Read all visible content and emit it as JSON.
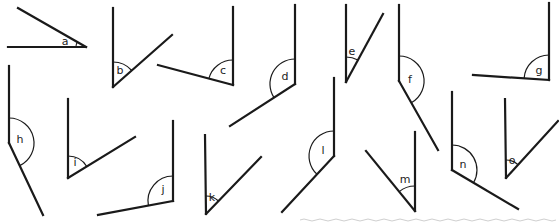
{
  "diagram": {
    "colors": {
      "line": "#1a1a1a",
      "background": "#ffffff"
    },
    "angles": [
      {
        "label": "a",
        "vertex": [
          86,
          47
        ],
        "arm1": [
          8,
          47
        ],
        "arm2": [
          18,
          8
        ],
        "r": 10,
        "lx": 65,
        "ly": 42
      },
      {
        "label": "b",
        "vertex": [
          113,
          87
        ],
        "arm1": [
          113,
          8
        ],
        "arm2": [
          172,
          35
        ],
        "r": 25,
        "lx": 120,
        "ly": 71
      },
      {
        "label": "c",
        "vertex": [
          233,
          85
        ],
        "arm1": [
          233,
          7
        ],
        "arm2": [
          158,
          65
        ],
        "r": 25,
        "lx": 223,
        "ly": 71
      },
      {
        "label": "d",
        "vertex": [
          295,
          84
        ],
        "arm1": [
          295,
          5
        ],
        "arm2": [
          230,
          126
        ],
        "r": 25,
        "lx": 285,
        "ly": 77
      },
      {
        "label": "e",
        "vertex": [
          346,
          82
        ],
        "arm1": [
          346,
          5
        ],
        "arm2": [
          383,
          14
        ],
        "r": 25,
        "lx": 352,
        "ly": 52
      },
      {
        "label": "f",
        "vertex": [
          399,
          81
        ],
        "arm1": [
          399,
          5
        ],
        "arm2": [
          438,
          150
        ],
        "r": 25,
        "lx": 410,
        "ly": 80
      },
      {
        "label": "g",
        "vertex": [
          549,
          80
        ],
        "arm1": [
          549,
          3
        ],
        "arm2": [
          473,
          75
        ],
        "r": 25,
        "lx": 539,
        "ly": 71
      },
      {
        "label": "h",
        "vertex": [
          9,
          143
        ],
        "arm1": [
          9,
          66
        ],
        "arm2": [
          43,
          215
        ],
        "r": 25,
        "lx": 20,
        "ly": 140
      },
      {
        "label": "i",
        "vertex": [
          68,
          178
        ],
        "arm1": [
          68,
          99
        ],
        "arm2": [
          135,
          137
        ],
        "r": 22,
        "lx": 75,
        "ly": 163
      },
      {
        "label": "j",
        "vertex": [
          173,
          201
        ],
        "arm1": [
          173,
          121
        ],
        "arm2": [
          98,
          215
        ],
        "r": 25,
        "lx": 163,
        "ly": 190
      },
      {
        "label": "k",
        "vertex": [
          206,
          214
        ],
        "arm1": [
          205,
          135
        ],
        "arm2": [
          261,
          157
        ],
        "r": 18,
        "lx": 212,
        "ly": 198
      },
      {
        "label": "l",
        "vertex": [
          334,
          156
        ],
        "arm1": [
          334,
          78
        ],
        "arm2": [
          282,
          212
        ],
        "r": 25,
        "lx": 323,
        "ly": 151
      },
      {
        "label": "m",
        "vertex": [
          415,
          211
        ],
        "arm1": [
          415,
          132
        ],
        "arm2": [
          366,
          151
        ],
        "r": 25,
        "lx": 405,
        "ly": 180
      },
      {
        "label": "n",
        "vertex": [
          452,
          170
        ],
        "arm1": [
          452,
          92
        ],
        "arm2": [
          518,
          209
        ],
        "r": 25,
        "lx": 463,
        "ly": 165
      },
      {
        "label": "o",
        "vertex": [
          506,
          178
        ],
        "arm1": [
          505,
          99
        ],
        "arm2": [
          558,
          121
        ],
        "r": 18,
        "lx": 512,
        "ly": 161
      }
    ]
  }
}
